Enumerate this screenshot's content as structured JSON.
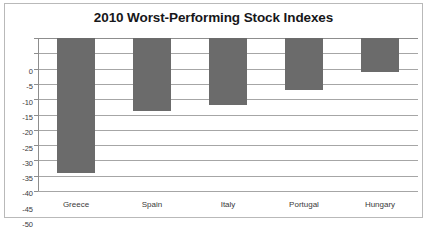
{
  "chart_data": {
    "type": "bar",
    "title": "2010 Worst-Performing Stock Indexes",
    "xlabel": "",
    "ylabel": "",
    "categories": [
      "Greece",
      "Spain",
      "Italy",
      "Portugal",
      "Hungary"
    ],
    "values": [
      -44,
      -24,
      -22,
      -17,
      -11
    ],
    "ylim": [
      -50,
      0
    ],
    "ytick_step": 5,
    "yticks": [
      0,
      -5,
      -10,
      -15,
      -20,
      -25,
      -30,
      -35,
      -40,
      -45,
      -50
    ],
    "ytick_labels": [
      "0",
      "-5",
      "-10",
      "-15",
      "-20",
      "-25",
      "-30",
      "-35",
      "-40",
      "-45",
      "-50"
    ],
    "grid": true,
    "legend": false,
    "bar_color": "#6b6b6b",
    "grid_color": "#a6a6a6",
    "axis_color": "#8d8d8d",
    "border_color": "#b9b9b9",
    "title_color": "#17171a",
    "label_color": "#3a3a3a"
  }
}
